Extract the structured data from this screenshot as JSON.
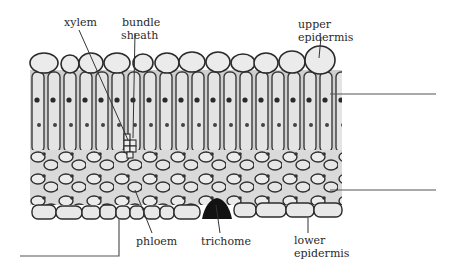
{
  "figure": {
    "type": "micrograph-diagram",
    "colors": {
      "background": "#ffffff",
      "tissue_fill": "#d6d6d6",
      "cell_wall": "#2b2b2b",
      "leader_line": "#333333",
      "blank_line": "#555555",
      "trichome": "#111111"
    }
  },
  "labels": [
    {
      "id": "xylem",
      "text": "xylem"
    },
    {
      "id": "bundle_sheath_1",
      "text": "bundle"
    },
    {
      "id": "bundle_sheath_2",
      "text": "sheath"
    },
    {
      "id": "upper_epidermis_1",
      "text": "upper"
    },
    {
      "id": "upper_epidermis_2",
      "text": "epidermis"
    },
    {
      "id": "phloem",
      "text": "phloem"
    },
    {
      "id": "trichome",
      "text": "trichome"
    },
    {
      "id": "lower_epidermis_1",
      "text": "lower"
    },
    {
      "id": "lower_epidermis_2",
      "text": "epidermis"
    }
  ],
  "blank_label_lines": [
    {
      "id": "blank-1",
      "target": "palisade mesophyll",
      "side": "right"
    },
    {
      "id": "blank-2",
      "target": "spongy mesophyll",
      "side": "right"
    },
    {
      "id": "blank-3",
      "target": "leaf thickness bracket",
      "side": "left-bottom"
    }
  ]
}
